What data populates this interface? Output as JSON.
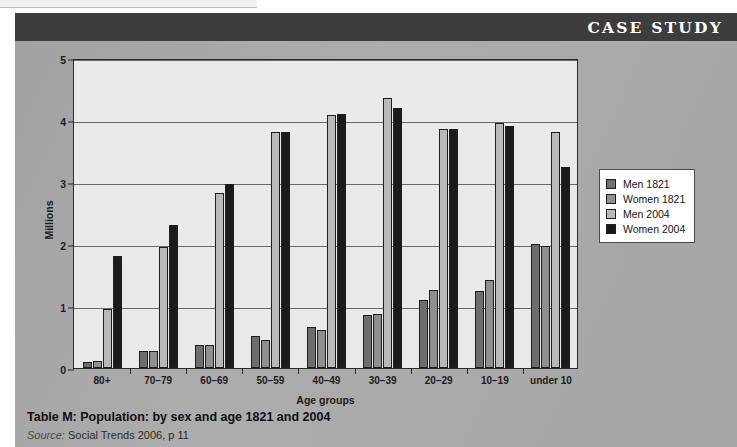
{
  "header": {
    "title": "CASE STUDY",
    "band_color": "#3d3d3d"
  },
  "panel": {
    "background_color": "#a8a8a8"
  },
  "caption": {
    "title": "Table M: Population: by sex and age 1821 and 2004",
    "source_lead": "Source:",
    "source_text": "Social Trends 2006, p 11"
  },
  "legend": {
    "entries": [
      {
        "label": "Men 1821",
        "color": "#6e6e6e"
      },
      {
        "label": "Women 1821",
        "color": "#8f8f8f"
      },
      {
        "label": "Men 2004",
        "color": "#b9b9b9"
      },
      {
        "label": "Women 2004",
        "color": "#1a1a1a"
      }
    ]
  },
  "chart_data": {
    "type": "bar",
    "title": "Table M: Population: by sex and age 1821 and 2004",
    "xlabel": "Age groups",
    "ylabel": "Millions",
    "ylim": [
      0,
      5
    ],
    "yticks": [
      0,
      1,
      2,
      3,
      4,
      5
    ],
    "grid": true,
    "legend_position": "right",
    "categories": [
      "80+",
      "70–79",
      "60–69",
      "50–59",
      "40–49",
      "30–39",
      "20–29",
      "10–19",
      "under 10"
    ],
    "series": [
      {
        "name": "Men 1821",
        "color": "#6e6e6e",
        "values": [
          0.1,
          0.27,
          0.37,
          0.51,
          0.66,
          0.86,
          1.1,
          1.24,
          2.0
        ]
      },
      {
        "name": "Women 1821",
        "color": "#8f8f8f",
        "values": [
          0.11,
          0.27,
          0.37,
          0.45,
          0.62,
          0.87,
          1.26,
          1.42,
          1.97
        ]
      },
      {
        "name": "Men 2004",
        "color": "#b9b9b9",
        "values": [
          0.95,
          1.95,
          2.82,
          3.8,
          4.08,
          4.35,
          3.85,
          3.95,
          3.8
        ]
      },
      {
        "name": "Women 2004",
        "color": "#1a1a1a",
        "values": [
          1.81,
          2.31,
          2.96,
          3.8,
          4.1,
          4.2,
          3.85,
          3.91,
          3.25
        ]
      }
    ]
  }
}
